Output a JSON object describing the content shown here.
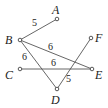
{
  "diagram": {
    "type": "weighted-graph",
    "nodes": [
      {
        "id": "A",
        "label": "A",
        "x": 57,
        "y": 19,
        "lx": 52,
        "ly": 14
      },
      {
        "id": "B",
        "label": "B",
        "x": 20,
        "y": 40,
        "lx": 5,
        "ly": 44
      },
      {
        "id": "C",
        "label": "C",
        "x": 20,
        "y": 69,
        "lx": 5,
        "ly": 79
      },
      {
        "id": "D",
        "label": "D",
        "x": 57,
        "y": 89,
        "lx": 51,
        "ly": 104
      },
      {
        "id": "E",
        "label": "E",
        "x": 92,
        "y": 69,
        "lx": 95,
        "ly": 79
      },
      {
        "id": "F",
        "label": "F",
        "x": 91,
        "y": 38,
        "lx": 95,
        "ly": 42
      }
    ],
    "edges": [
      {
        "from": "A",
        "to": "B",
        "weight": "5",
        "wx": 32,
        "wy": 26
      },
      {
        "from": "B",
        "to": "E",
        "weight": "6",
        "wx": 48,
        "wy": 50
      },
      {
        "from": "B",
        "to": "D",
        "weight": "6",
        "wx": 22,
        "wy": 60
      },
      {
        "from": "C",
        "to": "E",
        "weight": "6",
        "wx": 51,
        "wy": 66
      },
      {
        "from": "F",
        "to": "D",
        "weight": "5",
        "wx": 66,
        "wy": 82
      }
    ]
  }
}
